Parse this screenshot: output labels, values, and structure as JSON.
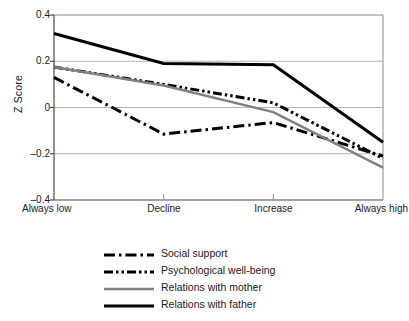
{
  "chart_data": {
    "type": "line",
    "title": "",
    "xlabel": "",
    "ylabel": "Z Score",
    "categories": [
      "Always low",
      "Decline",
      "Increase",
      "Always high"
    ],
    "ylim": [
      -0.4,
      0.4
    ],
    "yticks": [
      "0.4",
      "0.2",
      "0",
      "–0.2",
      "–0.4"
    ],
    "ytick_values": [
      0.4,
      0.2,
      0,
      -0.2,
      -0.4
    ],
    "grid": true,
    "legend_position": "bottom",
    "series": [
      {
        "name": "Social support",
        "values": [
          0.13,
          -0.115,
          -0.065,
          -0.21
        ],
        "color": "#000000",
        "style": "dash-dot",
        "width": 3
      },
      {
        "name": "Psychological well-being",
        "values": [
          0.175,
          0.1,
          0.02,
          -0.22
        ],
        "color": "#000000",
        "style": "dash-dot-dot",
        "width": 3
      },
      {
        "name": "Relations with mother",
        "values": [
          0.175,
          0.095,
          -0.02,
          -0.26
        ],
        "color": "#808080",
        "style": "solid",
        "width": 2.5
      },
      {
        "name": "Relations with father",
        "values": [
          0.32,
          0.19,
          0.185,
          -0.15
        ],
        "color": "#000000",
        "style": "solid",
        "width": 3
      }
    ]
  },
  "legend": {
    "items": [
      {
        "label": "Social support"
      },
      {
        "label": "Psychological well-being"
      },
      {
        "label": "Relations with mother"
      },
      {
        "label": "Relations with father"
      }
    ]
  },
  "axes": {
    "y_title": "Z Score"
  }
}
